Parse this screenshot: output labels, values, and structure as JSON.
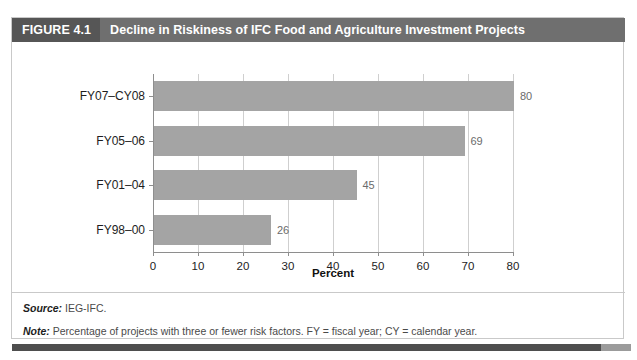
{
  "figure": {
    "number_label": "FIGURE 4.1",
    "title": "Decline in Riskiness of IFC Food and Agriculture Investment Projects"
  },
  "footnotes": {
    "source_label": "Source:",
    "source_text": " IEG-IFC.",
    "note_label": "Note:",
    "note_text": " Percentage of projects with three or fewer risk factors. FY = fiscal year; CY = calendar year."
  },
  "colors": {
    "header_bar": "#6f6f6f",
    "header_number_bar": "#565656",
    "bar_fill": "#a4a4a4",
    "gridline": "#cfcfcf",
    "axis": "#8e8e8e",
    "frame_border": "#c9c9c9"
  },
  "chart_data": {
    "type": "bar",
    "orientation": "horizontal",
    "title": "Decline in Riskiness of IFC Food and Agriculture Investment Projects",
    "categories": [
      "FY07–CY08",
      "FY05–06",
      "FY01–04",
      "FY98–00"
    ],
    "values": [
      80,
      69,
      45,
      26
    ],
    "value_labels": [
      "80",
      "69",
      "45",
      "26"
    ],
    "xlabel": "Percent",
    "ylabel": "",
    "xlim": [
      0,
      80
    ],
    "xticks": [
      0,
      10,
      20,
      30,
      40,
      50,
      60,
      70,
      80
    ],
    "xtick_labels": [
      "0",
      "10",
      "20",
      "30",
      "40",
      "50",
      "60",
      "70",
      "80"
    ],
    "grid": "vertical",
    "legend": "none",
    "series": [
      {
        "name": "Percentage of projects with three or fewer risk factors",
        "values": [
          80,
          69,
          45,
          26
        ]
      }
    ]
  }
}
